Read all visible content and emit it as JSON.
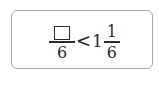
{
  "problem": {
    "left_fraction": {
      "numerator": "",
      "numerator_type": "blank-box",
      "denominator": "6"
    },
    "operator": "<",
    "right_mixed_number": {
      "whole": "1",
      "numerator": "1",
      "denominator": "6"
    }
  },
  "colors": {
    "border": "#a8a8a8",
    "text": "#2a2a2a",
    "background": "#ffffff"
  }
}
